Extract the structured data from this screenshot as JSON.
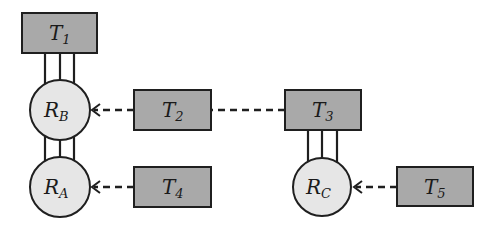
{
  "diagram": {
    "tasks": [
      {
        "id": "T1",
        "base": "T",
        "sub": "1"
      },
      {
        "id": "T2",
        "base": "T",
        "sub": "2"
      },
      {
        "id": "T3",
        "base": "T",
        "sub": "3"
      },
      {
        "id": "T4",
        "base": "T",
        "sub": "4"
      },
      {
        "id": "T5",
        "base": "T",
        "sub": "5"
      }
    ],
    "resources": [
      {
        "id": "RB",
        "base": "R",
        "sub": "B"
      },
      {
        "id": "RA",
        "base": "R",
        "sub": "A"
      },
      {
        "id": "RC",
        "base": "R",
        "sub": "C"
      }
    ],
    "edges": [
      {
        "from": "T1",
        "to": "RB",
        "style": "triple-solid"
      },
      {
        "from": "RB",
        "to": "RA",
        "style": "triple-solid"
      },
      {
        "from": "T3",
        "to": "RC",
        "style": "triple-solid"
      },
      {
        "from": "T2",
        "to": "RB",
        "style": "dashed-arrow"
      },
      {
        "from": "T3",
        "to": "T2",
        "style": "dashed"
      },
      {
        "from": "T4",
        "to": "RA",
        "style": "dashed-arrow"
      },
      {
        "from": "T5",
        "to": "RC",
        "style": "dashed-arrow"
      }
    ],
    "colors": {
      "task_fill": "#a9a9a9",
      "resource_fill": "#e6e6e6",
      "stroke": "#1f1f1f"
    }
  }
}
